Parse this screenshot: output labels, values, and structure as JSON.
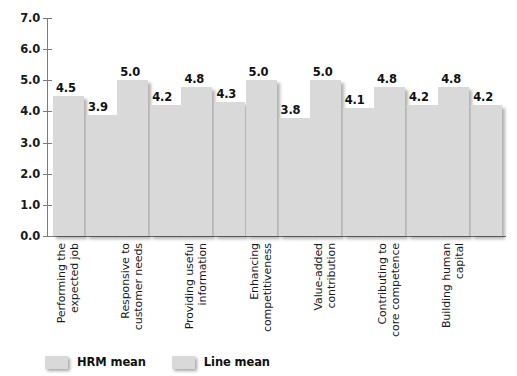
{
  "chart_data": {
    "type": "bar",
    "title": "",
    "subtitle": "",
    "xlabel": "",
    "ylabel": "",
    "ylim": [
      0.0,
      7.0
    ],
    "ytick_step": 1.0,
    "ytick_labels": [
      "7.0",
      "6.0",
      "5.0",
      "4.0",
      "3.0",
      "2.0",
      "1.0",
      "0.0"
    ],
    "ytick_values": [
      7.0,
      6.0,
      5.0,
      4.0,
      3.0,
      2.0,
      1.0,
      0.0
    ],
    "grid": false,
    "legend_position": "bottom-left",
    "categories": [
      "Performing the\nexpected job",
      "Responsive to\ncustomer needs",
      "Providing useful\ninformation",
      "Enhancing\ncompetitiveness",
      "Value-added\ncontribution",
      "Contributing to\ncore competence",
      "Building human\ncapital"
    ],
    "category_lines": [
      [
        "Performing the",
        "expected job"
      ],
      [
        "Responsive to",
        "customer needs"
      ],
      [
        "Providing useful",
        "information"
      ],
      [
        "Enhancing",
        "competitiveness"
      ],
      [
        "Value-added",
        "contribution"
      ],
      [
        "Contributing to",
        "core competence"
      ],
      [
        "Building human",
        "capital"
      ]
    ],
    "series": [
      {
        "name": "HRM mean",
        "color": "#d9d9d9",
        "values": [
          4.5,
          5.0,
          4.8,
          5.0,
          5.0,
          4.8,
          4.8
        ],
        "labels": [
          "4.5",
          "5.0",
          "4.8",
          "5.0",
          "5.0",
          "4.8",
          "4.8"
        ]
      },
      {
        "name": "Line mean",
        "color": "#d9d9d9",
        "values": [
          3.9,
          4.2,
          4.3,
          3.8,
          4.1,
          4.2,
          4.2
        ],
        "labels": [
          "3.9",
          "4.2",
          "4.3",
          "3.8",
          "4.1",
          "4.2",
          "4.2"
        ]
      }
    ]
  },
  "legend": {
    "items": [
      {
        "label": "HRM mean"
      },
      {
        "label": "Line mean"
      }
    ]
  },
  "axis": {
    "axis_color": "#7b7b7b"
  }
}
